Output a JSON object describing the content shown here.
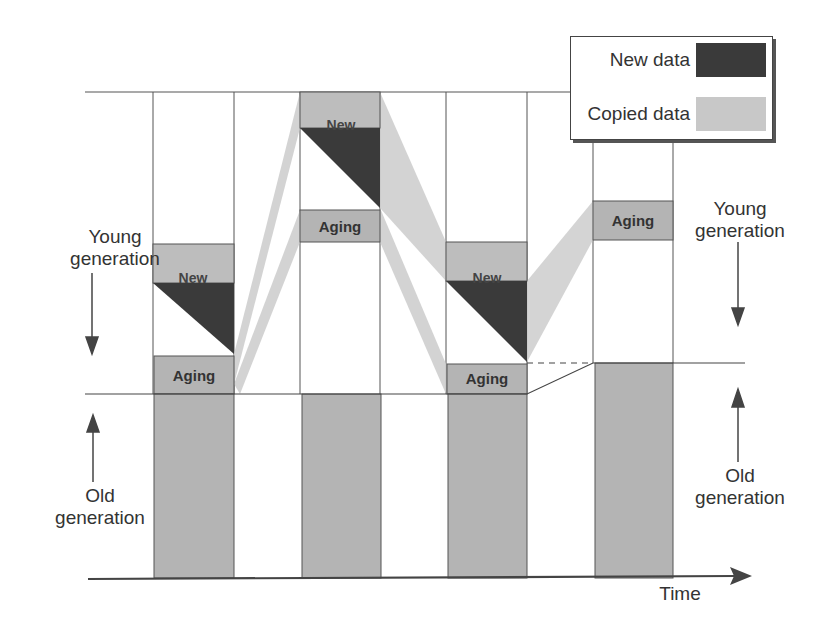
{
  "diagram": {
    "title": "",
    "axis": {
      "x_label": "Time"
    },
    "left_labels": {
      "young": {
        "line1": "Young",
        "line2": "generation"
      },
      "old": {
        "line1": "Old",
        "line2": "generation"
      }
    },
    "right_labels": {
      "young": {
        "line1": "Young",
        "line2": "generation"
      },
      "old": {
        "line1": "Old",
        "line2": "generation"
      }
    },
    "legend": {
      "items": [
        {
          "label": "New data",
          "color": "#3a3a3a"
        },
        {
          "label": "Copied data",
          "color": "#c8c8c8"
        }
      ]
    },
    "colors": {
      "new_data": "#3a3a3a",
      "copied_data": "#c8c8c8",
      "old_generation": "#b4b4b4",
      "aging": "#b4b4b4",
      "line": "#444444"
    },
    "columns": [
      {
        "id": 1,
        "new_label": "New",
        "aging_label": "Aging",
        "has_new": true
      },
      {
        "id": 2,
        "new_label": "New",
        "aging_label": "Aging",
        "has_new": true
      },
      {
        "id": 3,
        "new_label": "New",
        "aging_label": "Aging",
        "has_new": true
      },
      {
        "id": 4,
        "aging_label": "Aging",
        "has_new": false
      }
    ]
  }
}
